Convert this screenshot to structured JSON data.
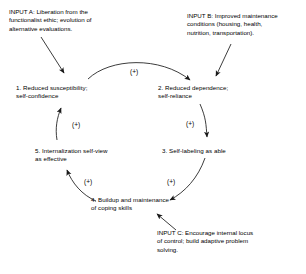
{
  "diagram": {
    "type": "causal-loop-diagram",
    "background_color": "#ffffff",
    "line_color": "#1a1a1a",
    "text_color": "#000000",
    "inputs": [
      {
        "id": "input-a",
        "label": "INPUT A: Liberation from the\nfunctionalist ethic; evolution of\nalternative evaluations.",
        "targets": "1. Reduced susceptibility;\nself-confidence"
      },
      {
        "id": "input-b",
        "label": "INPUT B: Improved maintenance\nconditions (housing, health,\nnutrition, transportation).",
        "targets": "2. Reduced dependence;\nself-reliance"
      },
      {
        "id": "input-c",
        "label": "INPUT C: Encourage internal locus\nof control; build adaptive problem\nsolving.",
        "targets": "4. Buildup and maintenance\nof coping skills"
      }
    ],
    "nodes": [
      {
        "id": "node-1",
        "label": "1. Reduced susceptibility;\nself-confidence"
      },
      {
        "id": "node-2",
        "label": "2. Reduced dependence;\nself-reliance"
      },
      {
        "id": "node-3",
        "label": "3. Self-labeling as able"
      },
      {
        "id": "node-4",
        "label": "4. Buildup and maintenance\nof coping skills"
      },
      {
        "id": "node-5",
        "label": "5. Internalization self-view\nas effective"
      }
    ],
    "links": [
      {
        "id": "link-1-2",
        "from": "node-1",
        "to": "node-2",
        "sign": "(+)"
      },
      {
        "id": "link-2-3",
        "from": "node-2",
        "to": "node-3",
        "sign": "(+)"
      },
      {
        "id": "link-3-4",
        "from": "node-3",
        "to": "node-4",
        "sign": "(+)"
      },
      {
        "id": "link-4-5",
        "from": "node-4",
        "to": "node-5",
        "sign": "(+)"
      },
      {
        "id": "link-5-1",
        "from": "node-5",
        "to": "node-1",
        "sign": "(+)"
      }
    ]
  }
}
